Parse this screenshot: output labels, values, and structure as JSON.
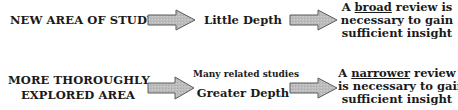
{
  "rows": [
    {
      "label_lines": [
        "NEW AREA OF STUDY"
      ],
      "middle_small": "",
      "middle": "Little Depth",
      "result": {
        "prefix": "A ",
        "emphasis": "broad",
        "suffix": " review is",
        "line2": "necessary to gain",
        "line3": "sufficient insight"
      }
    },
    {
      "label_lines": [
        "MORE THOROUGHLY",
        "EXPLORED AREA"
      ],
      "middle_small": "Many related studies",
      "middle": "Greater Depth",
      "result": {
        "prefix": "A ",
        "emphasis": "narrower",
        "suffix": " review",
        "line2": "is necessary to gain",
        "line3": "sufficient insight"
      }
    }
  ],
  "arrow_icon": "block-arrow-right",
  "colors": {
    "arrow_fill": "#b8b8b8",
    "arrow_stroke": "#5a5a5a",
    "text": "#1a1a1a"
  }
}
